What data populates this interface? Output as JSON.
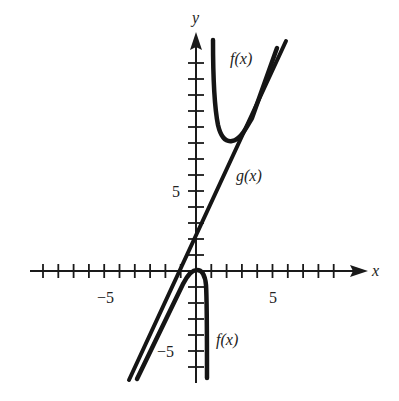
{
  "chart_data": {
    "type": "line",
    "title": "",
    "xlabel": "x",
    "ylabel": "y",
    "xlim": [
      -10.3,
      10.5
    ],
    "ylim": [
      -7,
      14.5
    ],
    "grid": false,
    "x_ticks": {
      "step": 1,
      "labeled": [
        {
          "value": -5,
          "label": "−5"
        },
        {
          "value": 5,
          "label": "5"
        }
      ]
    },
    "y_ticks": {
      "step": 1,
      "labeled": [
        {
          "value": 5,
          "label": "5"
        },
        {
          "value": -5,
          "label": "−5"
        }
      ]
    },
    "series": [
      {
        "name": "f(x)",
        "branch": "upper",
        "description": "Vertical asymptote near x=1, minimum near (2.1, 8.2), approaches slant asymptote g(x) as x increases",
        "points": [
          [
            1.1,
            14.4
          ],
          [
            1.2,
            12.0
          ],
          [
            1.4,
            10.0
          ],
          [
            1.7,
            8.6
          ],
          [
            2.1,
            8.2
          ],
          [
            2.6,
            8.6
          ],
          [
            3.5,
            10.2
          ],
          [
            4.5,
            12.1
          ],
          [
            5.3,
            13.7
          ]
        ]
      },
      {
        "name": "f(x)",
        "branch": "lower",
        "description": "Local maximum at origin (0, 0); left side approaches g(x) from below, right side drops toward vertical asymptote near x=1",
        "points": [
          [
            -3.8,
            -6.8
          ],
          [
            -2.5,
            -4.3
          ],
          [
            -1.5,
            -2.2
          ],
          [
            -0.7,
            -0.6
          ],
          [
            0,
            0
          ],
          [
            0.5,
            -0.6
          ],
          [
            0.7,
            -2.5
          ],
          [
            0.7,
            -4.5
          ],
          [
            0.7,
            -6.8
          ]
        ]
      },
      {
        "name": "g(x)",
        "description": "Slant asymptote, straight line with y-intercept ~2 and slope ~2",
        "points": [
          [
            -4.4,
            -6.8
          ],
          [
            0,
            2
          ],
          [
            5.8,
            14.4
          ]
        ]
      }
    ],
    "annotations": [
      {
        "text": "f(x)",
        "x": 3.5,
        "y": 13.2
      },
      {
        "text": "g(x)",
        "x": 3.4,
        "y": 5.9
      },
      {
        "text": "f(x)",
        "x": 1.3,
        "y": -4.4
      }
    ]
  },
  "labels": {
    "x_axis": "x",
    "y_axis": "y",
    "x_tick_neg5": "−5",
    "x_tick_5": "5",
    "y_tick_5": "5",
    "y_tick_neg5": "−5",
    "f_upper": "f(x)",
    "g_label": "g(x)",
    "f_lower": "f(x)"
  }
}
